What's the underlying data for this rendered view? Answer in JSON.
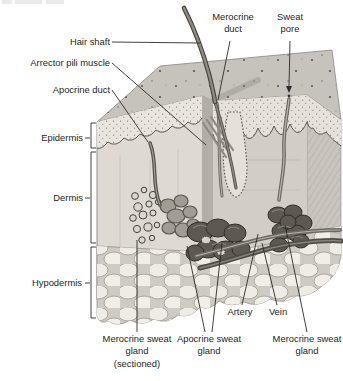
{
  "figure": {
    "labels": {
      "hair_shaft": "Hair shaft",
      "merocrine_duct": "Merocrine duct",
      "sweat_pore": "Sweat pore",
      "arrector_pili_muscle": "Arrector pili muscle",
      "apocrine_duct": "Apocrine duct",
      "epidermis": "Epidermis",
      "dermis": "Dermis",
      "hypodermis": "Hypodermis",
      "merocrine_sweat_gland_sectioned": "Merocrine sweat gland (sectioned)",
      "apocrine_sweat_gland": "Apocrine sweat gland",
      "artery": "Artery",
      "vein": "Vein",
      "merocrine_sweat_gland": "Merocrine sweat gland"
    },
    "colors": {
      "background": "#ffffff",
      "leader_line": "#2b2b2b",
      "text": "#1e1e1e",
      "skin_top_face": "#c6c3bd",
      "epidermis_band": "#e9e5de",
      "dermis_face": "#dedad3",
      "recessed_face": "#d2cec7",
      "fat_lobule": "#efece6",
      "gland_dark": "#5d5952",
      "hair": "#6e6a62"
    }
  }
}
